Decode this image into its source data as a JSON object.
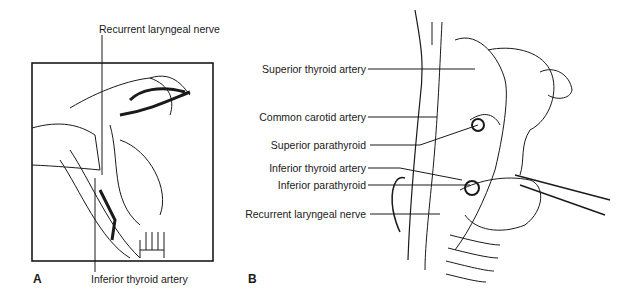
{
  "figure": {
    "panels": [
      {
        "id": "A",
        "letter": "A",
        "labels": {
          "top": "Recurrent laryngeal nerve",
          "bottom": "Inferior thyroid artery"
        }
      },
      {
        "id": "B",
        "letter": "B",
        "labels": [
          "Superior thyroid artery",
          "Common carotid artery",
          "Superior parathyroid",
          "Inferior thyroid artery",
          "Inferior parathyroid",
          "Recurrent laryngeal nerve"
        ]
      }
    ],
    "colors": {
      "ink": "#1a1a1a",
      "background": "#ffffff"
    }
  }
}
